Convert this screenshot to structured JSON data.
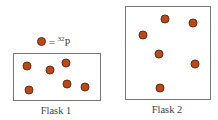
{
  "legend": {
    "equals": "=",
    "isotope_mass": "32",
    "element": "P",
    "marker_color": "#b8491d",
    "marker_outline": "#6e2a0e"
  },
  "flasks": [
    {
      "label": "Flask 1",
      "box": {
        "left": 13,
        "top": 53,
        "width": 88,
        "height": 48
      },
      "particles": [
        {
          "x": 27,
          "y": 66
        },
        {
          "x": 50,
          "y": 70
        },
        {
          "x": 66,
          "y": 63
        },
        {
          "x": 29,
          "y": 90
        },
        {
          "x": 67,
          "y": 84
        },
        {
          "x": 85,
          "y": 87
        }
      ],
      "label_pos": {
        "x": 56,
        "y": 105
      }
    },
    {
      "label": "Flask 2",
      "box": {
        "left": 125,
        "top": 6,
        "width": 86,
        "height": 94
      },
      "particles": [
        {
          "x": 165,
          "y": 19
        },
        {
          "x": 193,
          "y": 23
        },
        {
          "x": 143,
          "y": 35
        },
        {
          "x": 159,
          "y": 54
        },
        {
          "x": 195,
          "y": 64
        },
        {
          "x": 160,
          "y": 88
        }
      ],
      "label_pos": {
        "x": 167,
        "y": 104
      }
    }
  ]
}
